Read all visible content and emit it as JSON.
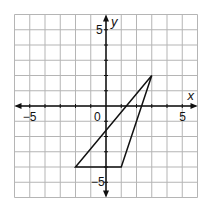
{
  "graph": {
    "x_axis_label": "x",
    "y_axis_label": "y",
    "origin_label": "0",
    "x_tick_labels": [
      {
        "value": -5,
        "text": "−5"
      },
      {
        "value": 5,
        "text": "5"
      }
    ],
    "y_tick_labels": [
      {
        "value": 5,
        "text": "5"
      },
      {
        "value": -5,
        "text": "−5"
      }
    ],
    "x_range": [
      -6,
      6
    ],
    "y_range": [
      -6,
      6
    ],
    "grid_step": 1,
    "colors": {
      "grid": "#b5b5b5",
      "axes": "#111111",
      "triangle": "#111111"
    }
  },
  "triangle": {
    "vertices": [
      {
        "x": 3,
        "y": 2
      },
      {
        "x": -2,
        "y": -4
      },
      {
        "x": 1,
        "y": -4
      }
    ]
  }
}
